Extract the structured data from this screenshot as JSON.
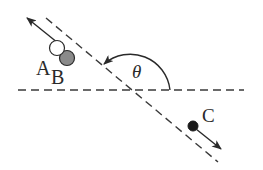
{
  "diagram": {
    "labels": {
      "a": "A",
      "b": "B",
      "c": "C",
      "angle": "θ"
    },
    "colors": {
      "line": "#3a3a3a",
      "ball_a_fill": "#ffffff",
      "ball_b_fill": "#8a8a8a",
      "ball_c_fill": "#1a1a1a"
    },
    "elements": [
      "horizontal dashed reference line",
      "diagonal dashed line",
      "angle arc with arrowhead marked θ",
      "ball A (open circle) with velocity arrow up-left",
      "ball B (gray filled circle)",
      "ball C (black filled circle) with velocity arrow down-right"
    ]
  }
}
